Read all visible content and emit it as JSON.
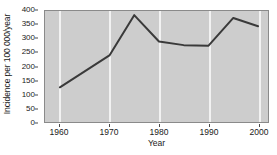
{
  "chart_data": {
    "type": "line",
    "title": "",
    "xlabel": "Year",
    "ylabel": "Incidence per 100 000/year",
    "xlim": [
      1957,
      2002
    ],
    "ylim": [
      0,
      400
    ],
    "grid": "vertical-only",
    "legend": "none",
    "x": [
      1960,
      1970,
      1975,
      1980,
      1985,
      1990,
      1995,
      2000
    ],
    "values": [
      125,
      240,
      385,
      290,
      277,
      275,
      375,
      345
    ],
    "series": [
      {
        "name": "Incidence",
        "x": [
          1960,
          1970,
          1975,
          1980,
          1985,
          1990,
          1995,
          2000
        ],
        "values": [
          125,
          240,
          385,
          290,
          277,
          275,
          375,
          345
        ]
      }
    ],
    "x_ticks": [
      1960,
      1970,
      1980,
      1990,
      2000
    ],
    "x_tick_labels": [
      "1960",
      "1970",
      "1980",
      "1990",
      "2000"
    ],
    "y_ticks": [
      0,
      50,
      100,
      150,
      200,
      250,
      300,
      350,
      400
    ],
    "y_tick_labels": [
      "0",
      "50",
      "100",
      "150",
      "200",
      "250",
      "300",
      "350",
      "400"
    ],
    "colors": {
      "line": "#3a3a3a",
      "plot_background": "#cdcdcd",
      "gridline": "#f2f2f2",
      "axis": "#8a8a8a",
      "page_background": "#ffffff",
      "text": "#1a1a1a"
    }
  }
}
